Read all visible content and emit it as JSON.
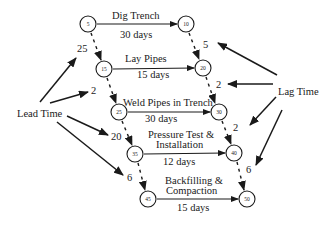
{
  "diagram": {
    "type": "precedence-network",
    "colors": {
      "line": "#1a1a1a",
      "background": "#ffffff"
    },
    "nodes": [
      {
        "id": "5",
        "label": "5"
      },
      {
        "id": "10",
        "label": "10"
      },
      {
        "id": "15",
        "label": "15"
      },
      {
        "id": "20",
        "label": "20"
      },
      {
        "id": "25",
        "label": "25"
      },
      {
        "id": "30",
        "label": "30"
      },
      {
        "id": "35",
        "label": "35"
      },
      {
        "id": "40",
        "label": "40"
      },
      {
        "id": "45",
        "label": "45"
      },
      {
        "id": "50",
        "label": "50"
      }
    ],
    "activities": [
      {
        "name": "Dig Trench",
        "duration": "30 days",
        "from": "5",
        "to": "10"
      },
      {
        "name": "Lay Pipes",
        "duration": "15 days",
        "from": "15",
        "to": "20"
      },
      {
        "name": "Weld Pipes in Trench",
        "duration": "30 days",
        "from": "25",
        "to": "30"
      },
      {
        "name_line1": "Pressure Test &",
        "name_line2": "Installation",
        "duration": "12 days",
        "from": "35",
        "to": "40"
      },
      {
        "name_line1": "Backfilling &",
        "name_line2": "Compaction",
        "duration": "15 days",
        "from": "45",
        "to": "50"
      }
    ],
    "lead_time": {
      "label": "Lead Time",
      "values": [
        "25",
        "2",
        "20",
        "6"
      ]
    },
    "lag_time": {
      "label": "Lag Time",
      "values": [
        "5",
        "2",
        "2",
        "6"
      ]
    }
  }
}
